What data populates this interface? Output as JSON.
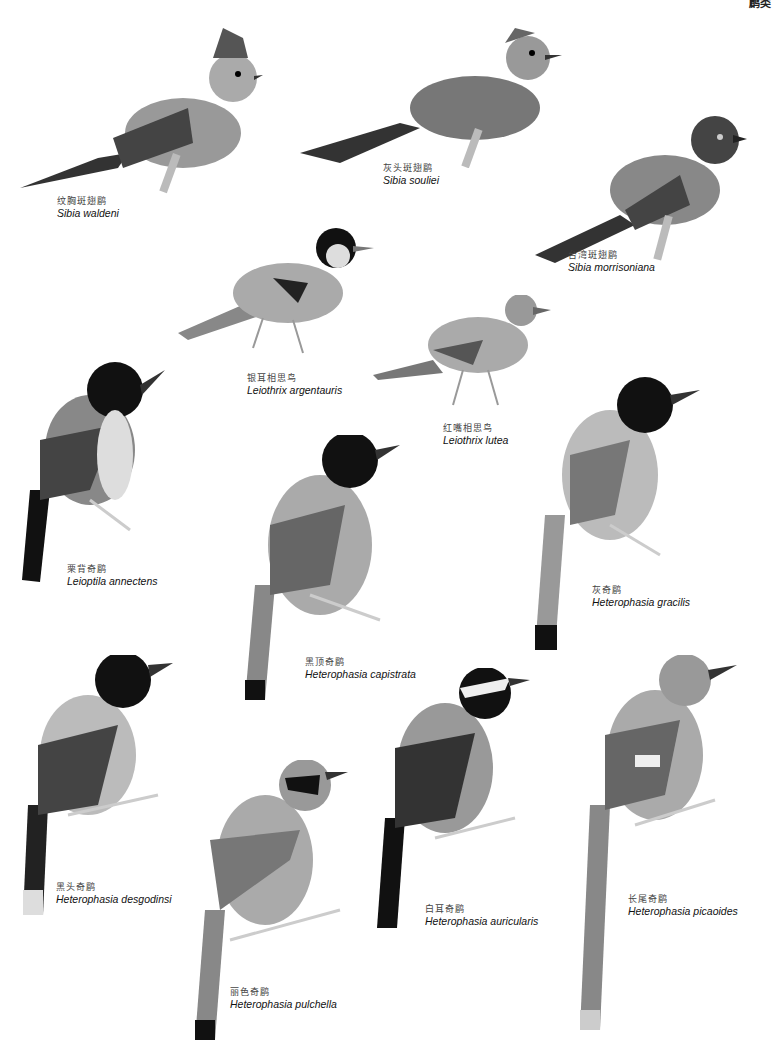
{
  "page": {
    "header_fragment": "鹛类"
  },
  "birds": [
    {
      "cn": "纹胸斑翅鹛",
      "sci": "Sibia waldeni"
    },
    {
      "cn": "灰头斑翅鹛",
      "sci": "Sibia souliei"
    },
    {
      "cn": "台湾斑翅鹛",
      "sci": "Sibia morrisoniana"
    },
    {
      "cn": "银耳相思鸟",
      "sci": "Leiothrix argentauris"
    },
    {
      "cn": "红嘴相思鸟",
      "sci": "Leiothrix lutea"
    },
    {
      "cn": "栗背奇鹛",
      "sci": "Leioptila annectens"
    },
    {
      "cn": "灰奇鹛",
      "sci": "Heterophasia gracilis"
    },
    {
      "cn": "黑顶奇鹛",
      "sci": "Heterophasia capistrata"
    },
    {
      "cn": "黑头奇鹛",
      "sci": "Heterophasia desgodinsi"
    },
    {
      "cn": "白耳奇鹛",
      "sci": "Heterophasia auricularis"
    },
    {
      "cn": "长尾奇鹛",
      "sci": "Heterophasia picaoides"
    },
    {
      "cn": "丽色奇鹛",
      "sci": "Heterophasia pulchella"
    }
  ]
}
